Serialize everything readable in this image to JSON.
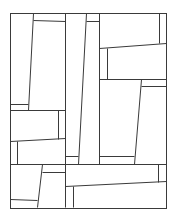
{
  "diagram": {
    "type": "line-art-tiling",
    "canvas": {
      "width": 173,
      "height": 216,
      "background": "#ffffff"
    },
    "stroke_color": "#3a3a3a",
    "frame": {
      "x": 10,
      "y": 13,
      "width": 156,
      "height": 195
    },
    "lines": [
      {
        "id": "top-left-slant",
        "x1": 33,
        "y1": 13,
        "x2": 28,
        "y2": 110
      },
      {
        "id": "top-left-cap",
        "x1": 33,
        "y1": 20,
        "x2": 65,
        "y2": 21
      },
      {
        "id": "left-small-h",
        "x1": 10,
        "y1": 104,
        "x2": 28,
        "y2": 104
      },
      {
        "id": "left-mid-h",
        "x1": 10,
        "y1": 110,
        "x2": 65,
        "y2": 110
      },
      {
        "id": "left-mid-v",
        "x1": 58,
        "y1": 110,
        "x2": 58,
        "y2": 139
      },
      {
        "id": "left-lower-slant",
        "x1": 10,
        "y1": 141,
        "x2": 65,
        "y2": 138
      },
      {
        "id": "left-lower-v",
        "x1": 17,
        "y1": 141,
        "x2": 17,
        "y2": 164
      },
      {
        "id": "col-a-v",
        "x1": 65,
        "y1": 13,
        "x2": 65,
        "y2": 207
      },
      {
        "id": "col-b-slant",
        "x1": 86,
        "y1": 13,
        "x2": 78,
        "y2": 164
      },
      {
        "id": "col-b-cap",
        "x1": 86,
        "y1": 21,
        "x2": 99,
        "y2": 21
      },
      {
        "id": "col-a-foot",
        "x1": 65,
        "y1": 156,
        "x2": 78,
        "y2": 156
      },
      {
        "id": "col-c-v",
        "x1": 99,
        "y1": 13,
        "x2": 99,
        "y2": 164
      },
      {
        "id": "right-top-v",
        "x1": 159,
        "y1": 13,
        "x2": 159,
        "y2": 43
      },
      {
        "id": "right-top-slant",
        "x1": 99,
        "y1": 48,
        "x2": 166,
        "y2": 43
      },
      {
        "id": "right-inner-v",
        "x1": 107,
        "y1": 48,
        "x2": 107,
        "y2": 79
      },
      {
        "id": "right-mid-h",
        "x1": 99,
        "y1": 79,
        "x2": 166,
        "y2": 79
      },
      {
        "id": "right-mid-cap",
        "x1": 141,
        "y1": 86,
        "x2": 166,
        "y2": 86
      },
      {
        "id": "right-mid-slant",
        "x1": 141,
        "y1": 79,
        "x2": 134,
        "y2": 164
      },
      {
        "id": "right-foot",
        "x1": 99,
        "y1": 156,
        "x2": 134,
        "y2": 156
      },
      {
        "id": "main-h",
        "x1": 10,
        "y1": 164,
        "x2": 166,
        "y2": 164
      },
      {
        "id": "bottom-left-slant",
        "x1": 42,
        "y1": 164,
        "x2": 37,
        "y2": 207
      },
      {
        "id": "bottom-left-cap",
        "x1": 42,
        "y1": 172,
        "x2": 65,
        "y2": 172
      },
      {
        "id": "bottom-left-foot",
        "x1": 10,
        "y1": 199,
        "x2": 37,
        "y2": 200
      },
      {
        "id": "bottom-right-v",
        "x1": 158,
        "y1": 164,
        "x2": 158,
        "y2": 182
      },
      {
        "id": "bottom-right-slant",
        "x1": 65,
        "y1": 186,
        "x2": 166,
        "y2": 181
      },
      {
        "id": "bottom-inner-v",
        "x1": 73,
        "y1": 186,
        "x2": 73,
        "y2": 207
      }
    ]
  }
}
